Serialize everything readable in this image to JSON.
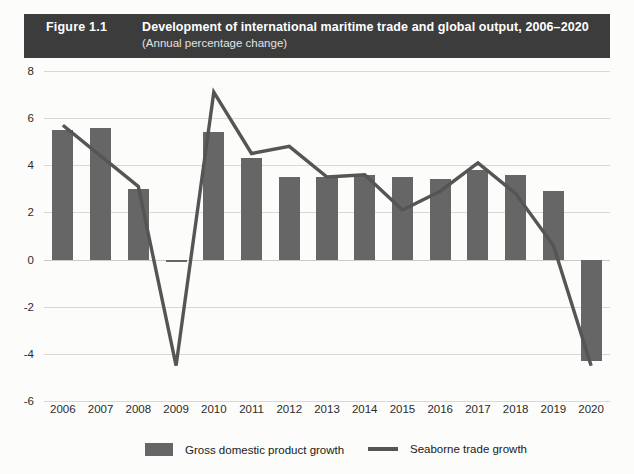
{
  "header": {
    "figure_number": "Figure 1.1",
    "title": "Development of international maritime trade and global output, 2006–2020",
    "subtitle": "(Annual percentage change)",
    "background_color": "#3c3c3c",
    "text_color": "#ffffff"
  },
  "colors": {
    "bar": "#666666",
    "line": "#555555",
    "grid": "#d8d8d6",
    "page_background": "#fcfcfa",
    "axis_text": "#2b2b2b"
  },
  "legend": {
    "items": [
      {
        "label": "Gross domestic product growth",
        "type": "bar",
        "color": "#666666"
      },
      {
        "label": "Seaborne trade growth",
        "type": "line",
        "color": "#555555"
      }
    ]
  },
  "axes": {
    "y_ticks": [
      "8",
      "6",
      "4",
      "2",
      "0",
      "-2",
      "-4",
      "-6"
    ],
    "y_min": -6,
    "y_max": 8,
    "y_step": 2,
    "x_ticks": [
      "2006",
      "2007",
      "2008",
      "2009",
      "2010",
      "2011",
      "2012",
      "2013",
      "2014",
      "2015",
      "2016",
      "2017",
      "2018",
      "2019",
      "2020"
    ]
  },
  "chart_data": {
    "type": "bar",
    "title": "Development of international maritime trade and global output, 2006–2020",
    "subtitle": "(Annual percentage change)",
    "xlabel": "",
    "ylabel": "",
    "ylim": [
      -6,
      8
    ],
    "ytick_step": 2,
    "grid": true,
    "legend_position": "bottom",
    "categories": [
      "2006",
      "2007",
      "2008",
      "2009",
      "2010",
      "2011",
      "2012",
      "2013",
      "2014",
      "2015",
      "2016",
      "2017",
      "2018",
      "2019",
      "2020"
    ],
    "series": [
      {
        "name": "Gross domestic product growth",
        "type": "bar",
        "color": "#666666",
        "values": [
          5.5,
          5.6,
          3.0,
          -0.1,
          5.4,
          4.3,
          3.5,
          3.5,
          3.6,
          3.5,
          3.4,
          3.8,
          3.6,
          2.9,
          -4.3
        ]
      },
      {
        "name": "Seaborne trade growth",
        "type": "line",
        "color": "#555555",
        "values": [
          5.7,
          4.4,
          3.1,
          -4.5,
          7.1,
          4.5,
          4.8,
          3.5,
          3.6,
          2.1,
          2.9,
          4.1,
          2.8,
          0.6,
          -4.5
        ]
      }
    ]
  }
}
